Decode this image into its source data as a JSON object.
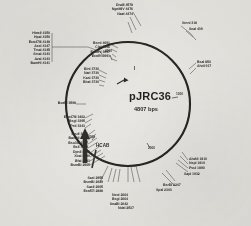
{
  "plasmid": {
    "name": "pJRC36",
    "size_label": "4807 bps",
    "size_bp": 4807,
    "topology": "circular",
    "center_x": 128,
    "center_y": 104,
    "radius": 62
  },
  "scale_ticks": [
    {
      "label": "1000",
      "position_bp": 1000
    },
    {
      "label": "2000",
      "position_bp": 2000
    },
    {
      "label": "3000",
      "position_bp": 3000
    },
    {
      "label": "4000",
      "position_bp": 4000
    }
  ],
  "features": [
    {
      "name": "I",
      "label": "I",
      "kind": "arrow-marker"
    },
    {
      "name": "HCAB",
      "label": "HCAB",
      "kind": "gene-arrow"
    }
  ],
  "site_groups": [
    {
      "id": "top-left-cluster",
      "anchor": "upper-left",
      "sites": [
        {
          "enzyme": "DraIII",
          "position": 4578,
          "label": "DraIII 4578"
        },
        {
          "enzyme": "NgoMIV",
          "position": 4476,
          "label": "NgoMIV 4476"
        },
        {
          "enzyme": "NaeI",
          "position": 4474,
          "label": "NaeI 4474"
        }
      ]
    },
    {
      "id": "far-left-stack",
      "anchor": "left-top",
      "sites": [
        {
          "enzyme": "HincII",
          "position": 4150,
          "label": "HincII 4150"
        },
        {
          "enzyme": "HpaI",
          "position": 4150,
          "label": "HpaI 4150"
        },
        {
          "enzyme": "Eco47III",
          "position": 4148,
          "label": "Eco47III 4148"
        },
        {
          "enzyme": "AccI",
          "position": 4147,
          "label": "AccI 4147"
        },
        {
          "enzyme": "TmaI",
          "position": 4145,
          "label": "TmaI 4145"
        },
        {
          "enzyme": "SmaI",
          "position": 4143,
          "label": "SmaI 4143"
        },
        {
          "enzyme": "AvaI",
          "position": 4143,
          "label": "AvaI 4143"
        },
        {
          "enzyme": "BamHI",
          "position": 4141,
          "label": "BamHI 4141"
        }
      ]
    },
    {
      "id": "upper-mid-stack",
      "anchor": "upper-mid-left",
      "sites": [
        {
          "enzyme": "BsmI",
          "position": 4091,
          "label": "BsmI 4091"
        },
        {
          "enzyme": "ClaI",
          "position": 3996,
          "label": "ClaI 3996"
        },
        {
          "enzyme": "EcoRV",
          "position": 3997,
          "label": "EcoRV 3997"
        },
        {
          "enzyme": "EcoRI",
          "position": 3991,
          "label": "EcoRI 3991"
        }
      ]
    },
    {
      "id": "left-3730-stack",
      "anchor": "left-upper",
      "sites": [
        {
          "enzyme": "BlnI",
          "position": 3730,
          "label": "BlnI 3730"
        },
        {
          "enzyme": "NarI",
          "position": 3730,
          "label": "NarI 3730"
        },
        {
          "enzyme": "KasI",
          "position": 3730,
          "label": "KasI 3730"
        },
        {
          "enzyme": "BbeI",
          "position": 3730,
          "label": "BbeI 3730"
        }
      ]
    },
    {
      "id": "bseri-single",
      "anchor": "left",
      "sites": [
        {
          "enzyme": "BseRI",
          "position": 3598,
          "label": "BseRI 3598"
        }
      ]
    },
    {
      "id": "left-mid-stack",
      "anchor": "left-mid",
      "sites": [
        {
          "enzyme": "Eco47III",
          "position": 3462,
          "label": "Eco47III 3462"
        },
        {
          "enzyme": "BsgI",
          "position": 3395,
          "label": "BsgI 3395"
        },
        {
          "enzyme": "PstI",
          "position": 3343,
          "label": "PstI 3343"
        }
      ]
    },
    {
      "id": "left-lower-stack",
      "anchor": "left-lower",
      "sites": [
        {
          "enzyme": "PvuII",
          "position": 3242,
          "label": "PvuII 3242"
        },
        {
          "enzyme": "BamHI",
          "position": 3172,
          "label": "BamHI 3172"
        },
        {
          "enzyme": "Bsu36I",
          "position": 3167,
          "label": "Bsu36I 3167"
        },
        {
          "enzyme": "BclI",
          "position": 3152,
          "label": "BclI 3152"
        }
      ]
    },
    {
      "id": "left-bottom-stack",
      "anchor": "left-bottom",
      "sites": [
        {
          "enzyme": "DpnII",
          "position": 3036,
          "label": "DpnII 3036"
        },
        {
          "enzyme": "XbaI",
          "position": 2989,
          "label": "XbaI 2989"
        },
        {
          "enzyme": "BfaI",
          "position": 2983,
          "label": "BfaI 2983"
        },
        {
          "enzyme": "BsmBI",
          "position": 2965,
          "label": "BsmBI 2965"
        }
      ]
    },
    {
      "id": "bottom-left-stack",
      "anchor": "bottom-left",
      "sites": [
        {
          "enzyme": "SacI",
          "position": 2955,
          "label": "SacI 2955"
        },
        {
          "enzyme": "BsmBI",
          "position": 2929,
          "label": "BsmBI 2929"
        },
        {
          "enzyme": "SacII",
          "position": 2905,
          "label": "SacII 2905"
        },
        {
          "enzyme": "Eco57I",
          "position": 2888,
          "label": "Eco57I 2888"
        }
      ]
    },
    {
      "id": "bottom-center-stack",
      "anchor": "bottom-center",
      "sites": [
        {
          "enzyme": "NcoI",
          "position": 2664,
          "label": "NcoI 2664"
        },
        {
          "enzyme": "BsgI",
          "position": 2664,
          "label": "BsgI 2664"
        },
        {
          "enzyme": "SnaBI",
          "position": 2642,
          "label": "SnaBI 2642"
        },
        {
          "enzyme": "NdeI",
          "position": 2537,
          "label": "NdeI 2537"
        }
      ]
    },
    {
      "id": "bottom-right-stack",
      "anchor": "bottom-right",
      "sites": [
        {
          "enzyme": "BsrDI",
          "position": 2247,
          "label": "BsrDI 2247"
        },
        {
          "enzyme": "SpeI",
          "position": 2303,
          "label": "SpeI 2303"
        }
      ]
    },
    {
      "id": "right-lower-stack",
      "anchor": "right-lower",
      "sites": [
        {
          "enzyme": "AlwNI",
          "position": 1810,
          "label": "AlwNI 1810"
        },
        {
          "enzyme": "NspI",
          "position": 1810,
          "label": "NspI 1810"
        },
        {
          "enzyme": "PvuI",
          "position": 1890,
          "label": "PvuI 1890"
        },
        {
          "enzyme": "SapI",
          "position": 1932,
          "label": "SapI 1932"
        }
      ]
    },
    {
      "id": "right-mid-stack",
      "anchor": "right-mid",
      "sites": [
        {
          "enzyme": "BsaI",
          "position": 850,
          "label": "BsaI 850"
        },
        {
          "enzyme": "AhdI",
          "position": 917,
          "label": "AhdI 917"
        }
      ]
    },
    {
      "id": "right-top-stack",
      "anchor": "right-top",
      "sites": [
        {
          "enzyme": "XmnI",
          "position": 318,
          "label": "XmnI 318"
        },
        {
          "enzyme": "ScaI",
          "position": 439,
          "label": "ScaI 439"
        }
      ]
    }
  ],
  "colors": {
    "background": "#e9e7e2",
    "ink": "#2a2724",
    "circle": "#181512",
    "leader": "#4a4641"
  }
}
